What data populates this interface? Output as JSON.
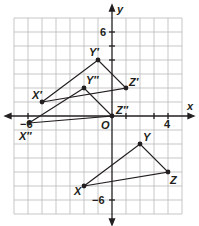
{
  "diagram": {
    "type": "coordinate-plane",
    "x_axis_label": "x",
    "y_axis_label": "y",
    "origin_label": "O",
    "tick_labels": {
      "x_neg": "−6",
      "x_pos": "4",
      "y_pos": "6",
      "y_neg": "−6"
    },
    "grid": {
      "xmin": -7,
      "xmax": 5,
      "ymin": -7,
      "ymax": 7,
      "step": 1
    },
    "colors": {
      "grid": "#b9b9b9",
      "axis": "#231f20",
      "line": "#231f20",
      "point": "#231f20"
    },
    "triangles": [
      {
        "name": "XYZ",
        "vertices": [
          {
            "label": "X",
            "x": -2,
            "y": -5
          },
          {
            "label": "Y",
            "x": 2,
            "y": -2
          },
          {
            "label": "Z",
            "x": 4,
            "y": -4
          }
        ]
      },
      {
        "name": "X'Y'Z'",
        "vertices": [
          {
            "label": "X′",
            "x": -5,
            "y": 1
          },
          {
            "label": "Y′",
            "x": -1,
            "y": 4
          },
          {
            "label": "Z′",
            "x": 1,
            "y": 2
          }
        ]
      },
      {
        "name": "X''Y''Z''",
        "vertices": [
          {
            "label": "X″",
            "x": -6,
            "y": -0.5
          },
          {
            "label": "Y″",
            "x": -2,
            "y": 2
          },
          {
            "label": "Z″",
            "x": 0,
            "y": 0
          }
        ]
      }
    ]
  }
}
